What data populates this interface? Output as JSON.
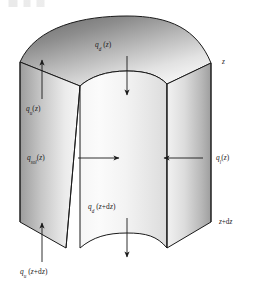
{
  "figure": {
    "domain": "diagram",
    "kind": "annular-sector-control-volume",
    "background_color": "#ffffff",
    "outline_color": "#1a1a1a",
    "top_face_fill_dark": "#6e6e6e",
    "top_face_fill_light": "#f2f2f2",
    "front_face_fill_dark": "#8a8a8a",
    "front_face_fill_light": "#fbfbfb",
    "side_face_fill_dark": "#9a9a9a",
    "side_face_fill_light": "#ededed",
    "arrow_color": "#1a1a1a"
  },
  "labels": {
    "flux_down_top": {
      "symbol": "q",
      "subscript": "d",
      "argument": "z",
      "text": "q_d (z)",
      "role": "downward-flux-at-z"
    },
    "flux_up_left": {
      "symbol": "q",
      "subscript": "u",
      "argument": "z",
      "text": "q_u (z)",
      "role": "upward-flux-at-z"
    },
    "flux_source_mid": {
      "symbol": "q",
      "subscript": "sol",
      "argument": "z",
      "text": "q_sol (z)",
      "role": "source-flux-inward-at-z"
    },
    "flux_lateral_right": {
      "symbol": "q",
      "subscript": "l",
      "argument": "z",
      "text": "q_l (z)",
      "role": "lateral-flux-at-z"
    },
    "flux_down_bottom": {
      "symbol": "q",
      "subscript": "d",
      "argument": "z+dz",
      "text": "q_d (z+dz)",
      "role": "downward-flux-at-z-plus-dz"
    },
    "flux_up_bottom": {
      "symbol": "q",
      "subscript": "u",
      "argument": "z+dz",
      "text": "q_u (z+dz)",
      "role": "upward-flux-at-z-plus-dz"
    }
  },
  "edge_markers": {
    "top": {
      "text": "z",
      "role": "upper-depth-level"
    },
    "bottom": {
      "text": "z+dz",
      "prefix": "z",
      "operator": "+",
      "suffix": "dz",
      "role": "lower-depth-level"
    }
  },
  "arrows": [
    {
      "name": "arrow-down-top",
      "direction": "down",
      "x": 127,
      "y_start": 56,
      "y_end": 96
    },
    {
      "name": "arrow-up-left",
      "direction": "up",
      "x": 42,
      "y_start": 99,
      "y_end": 59
    },
    {
      "name": "arrow-right-mid",
      "direction": "right",
      "y": 158,
      "x_start": 78,
      "x_end": 120
    },
    {
      "name": "arrow-left-right",
      "direction": "left",
      "y": 158,
      "x_start": 203,
      "x_end": 163
    },
    {
      "name": "arrow-down-bottom",
      "direction": "down",
      "x": 127,
      "y_start": 218,
      "y_end": 258
    },
    {
      "name": "arrow-up-bottom",
      "direction": "up",
      "x": 42,
      "y_start": 262,
      "y_end": 222
    }
  ]
}
